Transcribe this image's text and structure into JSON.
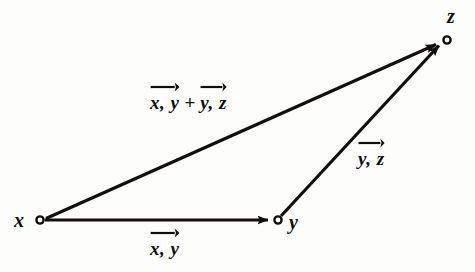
{
  "figure": {
    "type": "vector-triangle-diagram",
    "background_color": "#fdfdfc",
    "ink_color": "#100f0d",
    "vertices": [
      {
        "id": "x",
        "label": "x",
        "cx": 40,
        "cy": 220,
        "label_x": 14,
        "label_y": 210
      },
      {
        "id": "y",
        "label": "y",
        "cx": 278,
        "cy": 220,
        "label_x": 288,
        "label_y": 212
      },
      {
        "id": "z",
        "label": "z",
        "cx": 447,
        "cy": 40,
        "label_x": 447,
        "label_y": 6
      }
    ],
    "edges": [
      {
        "id": "x-to-y",
        "from": "x",
        "to": "y",
        "x1": 45,
        "y1": 220,
        "x2": 272,
        "y2": 220
      },
      {
        "id": "x-to-z",
        "from": "x",
        "to": "z",
        "x1": 46,
        "y1": 218,
        "x2": 441,
        "y2": 44
      },
      {
        "id": "y-to-z",
        "from": "y",
        "to": "z",
        "x1": 281,
        "y1": 216,
        "x2": 443,
        "y2": 45
      }
    ],
    "edge_labels": [
      {
        "id": "label-x-y",
        "for_edge": "x-to-y",
        "x": 150,
        "y": 228,
        "terms": [
          {
            "text": "x, y",
            "width": 46
          }
        ],
        "plus": null
      },
      {
        "id": "label-sum",
        "for_edge": "x-to-z",
        "x": 150,
        "y": 82,
        "terms": [
          {
            "text": "x, y",
            "width": 46
          },
          {
            "text": "y, z",
            "width": 44
          }
        ],
        "plus": "+"
      },
      {
        "id": "label-y-z",
        "for_edge": "y-to-z",
        "x": 358,
        "y": 138,
        "terms": [
          {
            "text": "y, z",
            "width": 44
          }
        ],
        "plus": null
      }
    ]
  }
}
